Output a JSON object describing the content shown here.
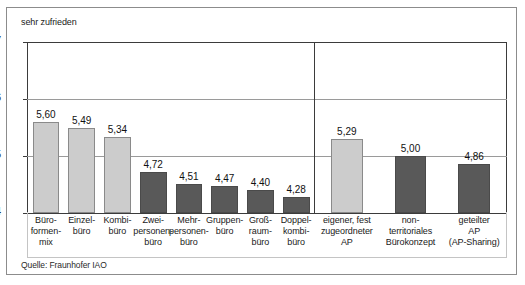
{
  "figure": {
    "axis_caption": "sehr zufrieden",
    "source_note": "Quelle: Fraunhofer IAO"
  },
  "chart_data": {
    "type": "bar",
    "title": "",
    "subtitle": "",
    "xlabel": "",
    "ylabel": "sehr zufrieden",
    "ylim": [
      4,
      7
    ],
    "ytick_labels": [
      "7",
      "6",
      "5",
      "4"
    ],
    "yticks": [
      7,
      6,
      5,
      4
    ],
    "grid": true,
    "legend": "none",
    "value_format": "comma-decimal",
    "categories": [
      "Büro-\nformen-\nmix",
      "Einzel-\nbüro",
      "Kombi-\nbüro",
      "Zwei-\npersonen-\nbüro",
      "Mehr-\npersonen-\nbüro",
      "Gruppen-\nbüro",
      "Groß-\nraum-\nbüro",
      "Doppel-\nkombi-\nbüro",
      "eigener, fest\nzugeordneter\nAP",
      "non-\nterritoriales\nBürokonzept",
      "geteilter\nAP\n(AP-Sharing)"
    ],
    "values": [
      5.6,
      5.49,
      5.34,
      4.72,
      4.51,
      4.47,
      4.4,
      4.28,
      5.29,
      5.0,
      4.86
    ],
    "value_labels": [
      "5,60",
      "5,49",
      "5,34",
      "4,72",
      "4,51",
      "4,47",
      "4,40",
      "4,28",
      "5,29",
      "5,00",
      "4,86"
    ],
    "bar_colors": [
      "light",
      "light",
      "light",
      "dark",
      "dark",
      "dark",
      "dark",
      "dark",
      "light",
      "dark",
      "dark"
    ],
    "colors": {
      "light": "#cccccc",
      "dark": "#595959",
      "axis": "#3b3b3b",
      "grid": "#9a9a9a",
      "frame": "#8c8c8c"
    },
    "groups": [
      {
        "name": "Büroformen",
        "start_index": 0,
        "end_index": 7
      },
      {
        "name": "Arbeitsplatzkonzepte",
        "start_index": 8,
        "end_index": 10
      }
    ],
    "group_divider_after_index": 7
  },
  "bars": [
    {
      "label": "Büro-\nformen-\nmix",
      "value_label": "5,60",
      "value": 5.6,
      "color": "light"
    },
    {
      "label": "Einzel-\nbüro",
      "value_label": "5,49",
      "value": 5.49,
      "color": "light"
    },
    {
      "label": "Kombi-\nbüro",
      "value_label": "5,34",
      "value": 5.34,
      "color": "light"
    },
    {
      "label": "Zwei-\npersonen-\nbüro",
      "value_label": "4,72",
      "value": 4.72,
      "color": "dark"
    },
    {
      "label": "Mehr-\npersonen-\nbüro",
      "value_label": "4,51",
      "value": 4.51,
      "color": "dark"
    },
    {
      "label": "Gruppen-\nbüro",
      "value_label": "4,47",
      "value": 4.47,
      "color": "dark"
    },
    {
      "label": "Groß-\nraum-\nbüro",
      "value_label": "4,40",
      "value": 4.4,
      "color": "dark"
    },
    {
      "label": "Doppel-\nkombi-\nbüro",
      "value_label": "4,28",
      "value": 4.28,
      "color": "dark"
    },
    {
      "label": "eigener, fest\nzugeordneter\nAP",
      "value_label": "5,29",
      "value": 5.29,
      "color": "light"
    },
    {
      "label": "non-\nterritoriales\nBürokonzept",
      "value_label": "5,00",
      "value": 5.0,
      "color": "dark"
    },
    {
      "label": "geteilter\nAP\n(AP-Sharing)",
      "value_label": "4,86",
      "value": 4.86,
      "color": "dark"
    }
  ]
}
